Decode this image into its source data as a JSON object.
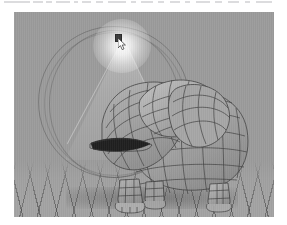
{
  "app": {
    "title": "3D Modeling Viewport",
    "viewport_label": "perspective-viewport"
  },
  "toolbar": {
    "visible": true,
    "description": "cropped toolbar strip, text illegible",
    "items": [
      {
        "label": "",
        "x": 4,
        "w": 26
      },
      {
        "label": "",
        "x": 33,
        "w": 10
      },
      {
        "label": "",
        "x": 46,
        "w": 6
      },
      {
        "label": "",
        "x": 56,
        "w": 14
      },
      {
        "label": "",
        "x": 74,
        "w": 4
      },
      {
        "label": "",
        "x": 82,
        "w": 9
      },
      {
        "label": "",
        "x": 96,
        "w": 7
      },
      {
        "label": "",
        "x": 108,
        "w": 18
      },
      {
        "label": "",
        "x": 131,
        "w": 5
      },
      {
        "label": "",
        "x": 141,
        "w": 12
      },
      {
        "label": "",
        "x": 158,
        "w": 6
      },
      {
        "label": "",
        "x": 170,
        "w": 10
      },
      {
        "label": "",
        "x": 185,
        "w": 5
      },
      {
        "label": "",
        "x": 196,
        "w": 14
      },
      {
        "label": "",
        "x": 215,
        "w": 7
      },
      {
        "label": "",
        "x": 228,
        "w": 11
      },
      {
        "label": "",
        "x": 245,
        "w": 5
      },
      {
        "label": "",
        "x": 256,
        "w": 16
      }
    ]
  },
  "viewport": {
    "background_color": "#9b9b9b",
    "ground_color": "#a3a3a3",
    "grid_line_color": "#3c3c3c",
    "wireframe_color": "#3a3a3a",
    "shading": "smooth-gray",
    "objects": [
      {
        "name": "hippo-mesh",
        "type": "polygon-mesh",
        "display": "wireframe-on-shaded",
        "selected": false
      },
      {
        "name": "point-light",
        "type": "light",
        "display": "glow-with-sphere-gizmo",
        "selected": true,
        "glow_color": "#ffffff"
      },
      {
        "name": "ground-grid",
        "type": "grid-plane",
        "display": "perspective-grid"
      }
    ]
  },
  "cursor": {
    "type": "arrow",
    "x": 104,
    "y": 26
  }
}
